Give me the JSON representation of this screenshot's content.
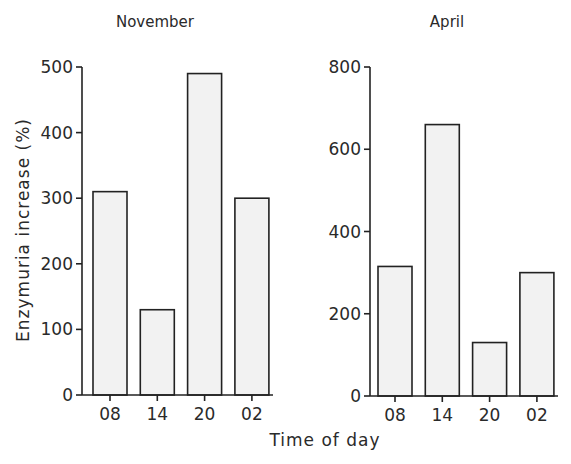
{
  "chart_data": [
    {
      "type": "bar",
      "title": "November",
      "categories": [
        "08",
        "14",
        "20",
        "02"
      ],
      "values": [
        310,
        130,
        490,
        300
      ],
      "xlabel": "Time of day",
      "ylabel": "Enzymuria increase (%)",
      "ylim": [
        0,
        500
      ],
      "yticks": [
        0,
        100,
        200,
        300,
        400,
        500
      ],
      "grid": false,
      "legend": null
    },
    {
      "type": "bar",
      "title": "April",
      "categories": [
        "08",
        "14",
        "20",
        "02"
      ],
      "values": [
        315,
        660,
        130,
        300
      ],
      "xlabel": "Time of day",
      "ylabel": "Enzymuria increase (%)",
      "ylim": [
        0,
        800
      ],
      "yticks": [
        0,
        200,
        400,
        600,
        800
      ],
      "grid": false,
      "legend": null
    }
  ],
  "shared": {
    "xlabel": "Time of day",
    "ylabel": "Enzymuria increase (%)"
  },
  "colors": {
    "bar_fill": "#f2f2f2",
    "bar_stroke": "#222222",
    "axis": "#222222",
    "text": "#2a2a2a"
  }
}
